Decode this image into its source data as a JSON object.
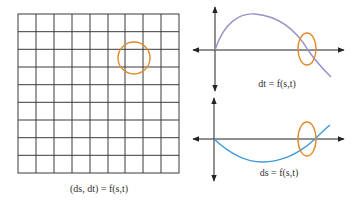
{
  "colors": {
    "grid": "#3a3a3a",
    "axis": "#222222",
    "highlight": "#e08a2a",
    "dt_curve": "#9b8fc8",
    "ds_curve": "#3d9ad9",
    "background": "#ffffff"
  },
  "grid_panel": {
    "columns": 9,
    "rows": 9,
    "caption": "(ds, dt) = f(s,t)",
    "highlight_circle": {
      "shape": "circle",
      "cell_col": 6,
      "cell_row": 2
    }
  },
  "plots": [
    {
      "id": "dt-plot",
      "caption": "dt = f(s,t)",
      "curve": "rises from origin to a peak, then falls and crosses the horizontal axis",
      "highlight": "ellipse at the axis crossing"
    },
    {
      "id": "ds-plot",
      "caption": "ds = f(s,t)",
      "curve": "dips below axis from origin to a minimum, then rises and crosses the horizontal axis",
      "highlight": "ellipse at the axis crossing"
    }
  ]
}
